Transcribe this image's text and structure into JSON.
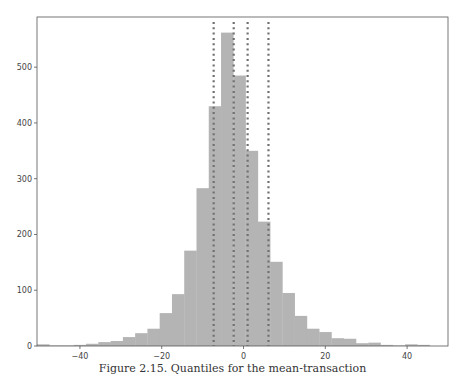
{
  "caption": "Figure 2.15. Quantiles for the mean-transaction",
  "colors": {
    "bar_fill": "#b4b4b4",
    "quantile_line": "#707070",
    "axis": "#555555",
    "background": "#ffffff"
  },
  "chart_data": {
    "type": "bar",
    "title": "",
    "xlabel": "",
    "ylabel": "",
    "xlim": [
      -50.5,
      50
    ],
    "ylim": [
      0,
      590
    ],
    "grid": false,
    "legend": null,
    "x_ticks": [
      -40,
      -20,
      0,
      20,
      40
    ],
    "y_ticks": [
      0,
      100,
      200,
      300,
      400,
      500
    ],
    "bin_width": 3,
    "bin_start": -50.5,
    "values": [
      3,
      1,
      1,
      2,
      4,
      7,
      9,
      16,
      23,
      31,
      59,
      93,
      171,
      283,
      430,
      562,
      485,
      350,
      223,
      151,
      95,
      54,
      31,
      25,
      14,
      13,
      5,
      6,
      2,
      1,
      3,
      2
    ],
    "quantile_lines": [
      -7.3,
      -2.4,
      1.0,
      6.1
    ],
    "annotations": [
      "vertical dotted lines mark quantiles"
    ]
  }
}
